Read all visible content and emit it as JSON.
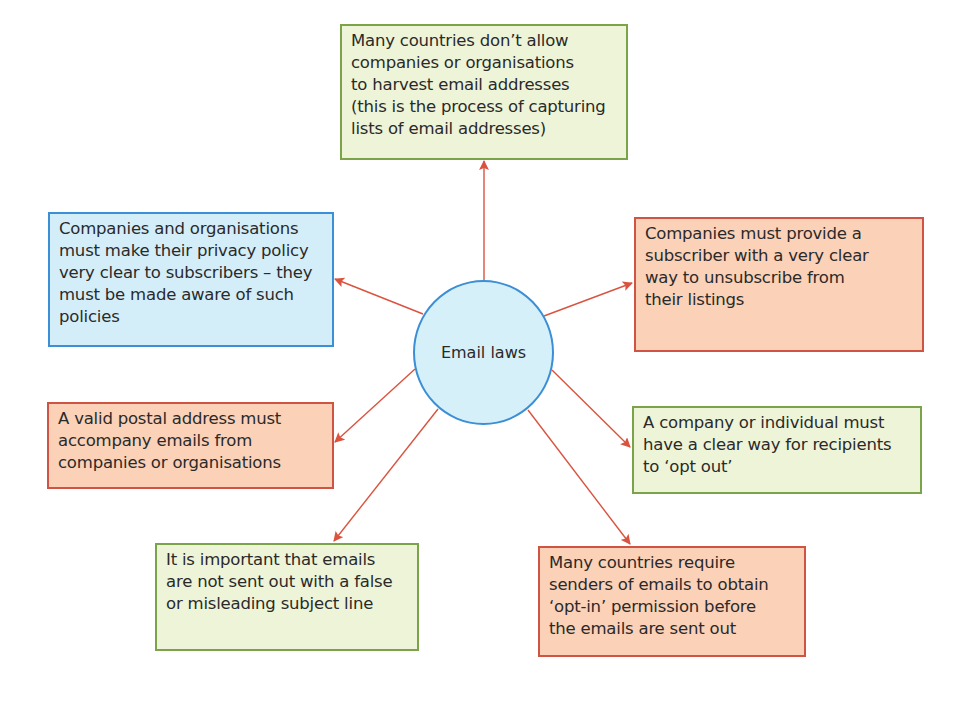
{
  "diagram": {
    "type": "mind-map",
    "center": {
      "label": "Email laws"
    },
    "nodes": [
      {
        "id": "harvest",
        "text": "Many countries don’t allow\ncompanies or organisations\nto harvest email addresses\n(this is the process of capturing\nlists of email addresses)",
        "color": "green"
      },
      {
        "id": "privacy-policy",
        "text": "Companies and organisations\nmust make their privacy policy\nvery clear to subscribers – they\nmust be made aware of such\npolicies",
        "color": "blue"
      },
      {
        "id": "unsubscribe",
        "text": "Companies must provide a\nsubscriber with a very clear\nway to unsubscribe from\ntheir listings",
        "color": "orange"
      },
      {
        "id": "postal-address",
        "text": "A valid postal address must\naccompany emails from\ncompanies or organisations",
        "color": "orange"
      },
      {
        "id": "opt-out",
        "text": "A company or individual must\nhave a clear way for recipients\nto ‘opt out’",
        "color": "green"
      },
      {
        "id": "subject-line",
        "text": "It is important that emails\nare not sent out with a false\nor misleading subject line",
        "color": "green"
      },
      {
        "id": "opt-in",
        "text": "Many countries require\nsenders of emails to obtain\n‘opt-in’ permission before\nthe emails are sent out",
        "color": "orange"
      }
    ],
    "colors": {
      "green_fill": "#eef4d7",
      "green_border": "#7aa34a",
      "blue_fill": "#d4eef9",
      "blue_border": "#3a8fd6",
      "orange_fill": "#fbd1b7",
      "orange_border": "#cf5444",
      "arrow": "#d9533f"
    }
  }
}
